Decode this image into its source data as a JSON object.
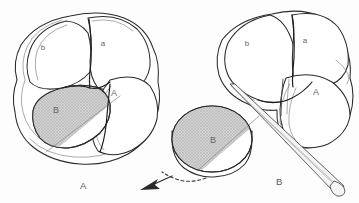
{
  "figure": {
    "background_color": "#fdfdfd",
    "ink_color": "#2b2b2b",
    "shade_color": "#c8c8c8",
    "label_color": "#666666"
  },
  "panels": [
    {
      "id": "panel-a",
      "caption": "A",
      "description": "Intact four-cell embryo with blastomere B shaded",
      "cells": [
        {
          "id": "cell-b-lower",
          "label": "b",
          "shaded": false,
          "x": 43,
          "y": 47
        },
        {
          "id": "cell-a-lower",
          "label": "a",
          "shaded": false,
          "x": 103,
          "y": 43
        },
        {
          "id": "cell-a-upper",
          "label": "A",
          "shaded": false,
          "x": 113,
          "y": 93
        },
        {
          "id": "cell-b-upper",
          "label": "B",
          "shaded": true,
          "x": 55,
          "y": 110
        }
      ]
    },
    {
      "id": "panel-b",
      "caption": "B",
      "description": "Three-cell remainder with blastomere B removed by glass needle",
      "cells": [
        {
          "id": "cell-b-lower",
          "label": "b",
          "shaded": false,
          "x": 247,
          "y": 43
        },
        {
          "id": "cell-a-lower",
          "label": "a",
          "shaded": false,
          "x": 305,
          "y": 40
        },
        {
          "id": "cell-a-upper",
          "label": "A",
          "shaded": false,
          "x": 315,
          "y": 92
        },
        {
          "id": "cell-b-isolated",
          "label": "B",
          "shaded": true,
          "x": 213,
          "y": 140
        }
      ],
      "instrument": {
        "id": "glass-needle",
        "label": ""
      },
      "motion_arrow": {
        "id": "removal-arrow",
        "direction": "down-left"
      }
    }
  ]
}
